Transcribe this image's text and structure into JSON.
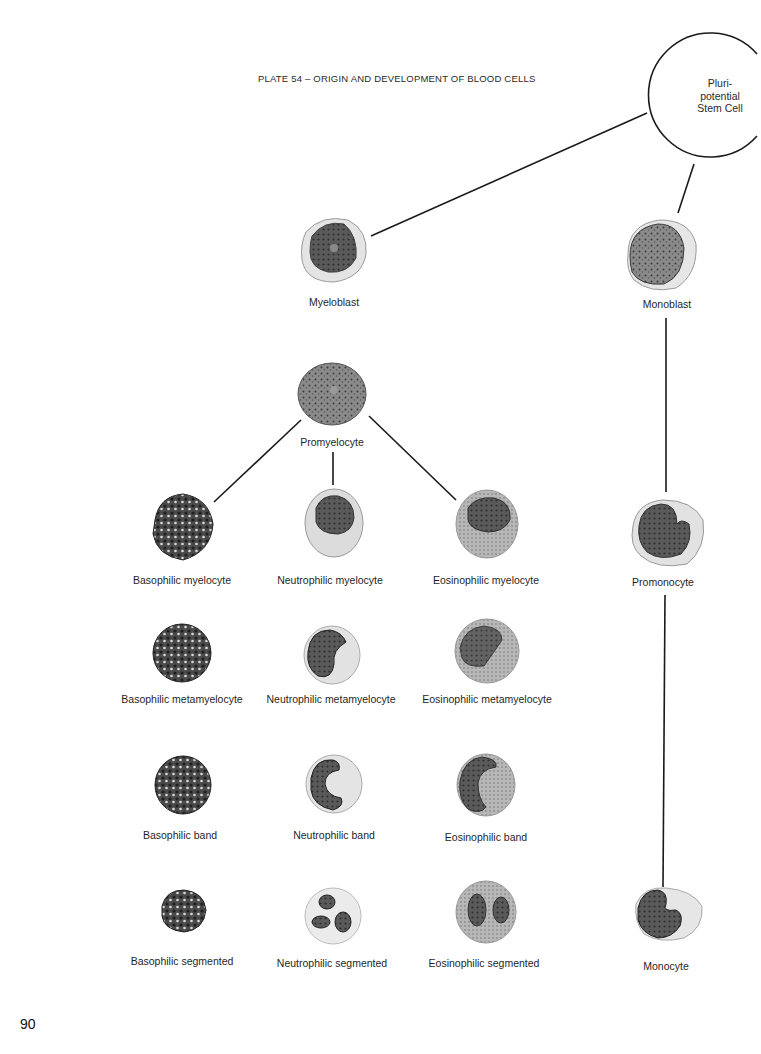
{
  "title": "PLATE 54 – ORIGIN AND DEVELOPMENT OF BLOOD CELLS",
  "page_number": "90",
  "stem_cell": {
    "lines": [
      "Pluri-",
      "potential",
      "Stem Cell"
    ]
  },
  "cells": {
    "myeloblast": "Myeloblast",
    "monoblast": "Monoblast",
    "promyelocyte": "Promyelocyte",
    "promonocyte": "Promonocyte",
    "monocyte": "Monocyte",
    "basophilic_myelocyte": "Basophilic myelocyte",
    "neutrophilic_myelocyte": "Neutrophilic myelocyte",
    "eosinophilic_myelocyte": "Eosinophilic myelocyte",
    "basophilic_metamyelocyte": "Basophilic metamyelocyte",
    "neutrophilic_metamyelocyte": "Neutrophilic metamyelocyte",
    "eosinophilic_metamyelocyte": "Eosinophilic metamyelocyte",
    "basophilic_band": "Basophilic band",
    "neutrophilic_band": "Neutrophilic band",
    "eosinophilic_band": "Eosinophilic band",
    "basophilic_segmented": "Basophilic segmented",
    "neutrophilic_segmented": "Neutrophilic segmented",
    "eosinophilic_segmented": "Eosinophilic segmented"
  },
  "connections": [
    [
      "Pluripotential Stem Cell",
      "Myeloblast"
    ],
    [
      "Pluripotential Stem Cell",
      "Monoblast"
    ],
    [
      "Myeloblast",
      "Promyelocyte"
    ],
    [
      "Promyelocyte",
      "Basophilic myelocyte"
    ],
    [
      "Promyelocyte",
      "Neutrophilic myelocyte"
    ],
    [
      "Promyelocyte",
      "Eosinophilic myelocyte"
    ],
    [
      "Monoblast",
      "Promonocyte"
    ],
    [
      "Promonocyte",
      "Monocyte"
    ]
  ]
}
